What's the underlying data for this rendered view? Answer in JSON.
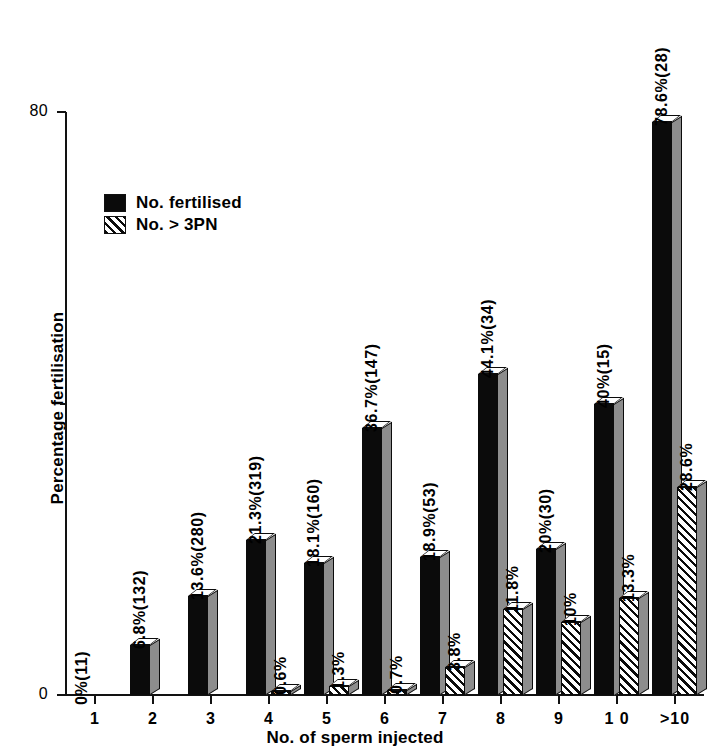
{
  "chart_data": {
    "type": "bar",
    "title": "",
    "xlabel": "No. of sperm injected",
    "ylabel": "Percentage fertilisation",
    "ylim": [
      0,
      80
    ],
    "ytick_labels": [
      "0",
      "80"
    ],
    "grid": false,
    "legend_position": "upper-left",
    "categories": [
      "1",
      "2",
      "3",
      "4",
      "5",
      "6",
      "7",
      "8",
      "9",
      "1 0",
      ">10"
    ],
    "series": [
      {
        "name": "No. fertilised",
        "fill": "solid",
        "color": "#0b0b0b",
        "values": [
          0,
          6.8,
          13.6,
          21.3,
          18.1,
          36.7,
          18.9,
          44.1,
          20,
          40,
          78.6
        ],
        "labels": [
          "0%(11)",
          "6.8%(132)",
          "13.6%(280)",
          "21.3%(319)",
          "18.1%(160)",
          "36.7%(147)",
          "18.9%(53)",
          "44.1%(34)",
          "20%(30)",
          "40%(15)",
          "78.6%(28)"
        ],
        "counts": [
          11,
          132,
          280,
          319,
          160,
          147,
          53,
          34,
          30,
          15,
          28
        ]
      },
      {
        "name": "No. > 3PN",
        "fill": "hatch",
        "color": "#0b0b0b",
        "values": [
          null,
          null,
          null,
          0.6,
          1.3,
          0.7,
          3.8,
          11.8,
          10,
          13.3,
          28.6
        ],
        "labels": [
          "",
          "",
          "",
          "0.6%",
          "1.3%",
          "0.7%",
          "3.8%",
          "11.8%",
          "10%",
          "13.3%",
          "28.6%"
        ]
      }
    ]
  },
  "legend": {
    "items": [
      {
        "label": "No. fertilised",
        "fill": "solid"
      },
      {
        "label": "No. > 3PN",
        "fill": "hatch"
      }
    ]
  }
}
